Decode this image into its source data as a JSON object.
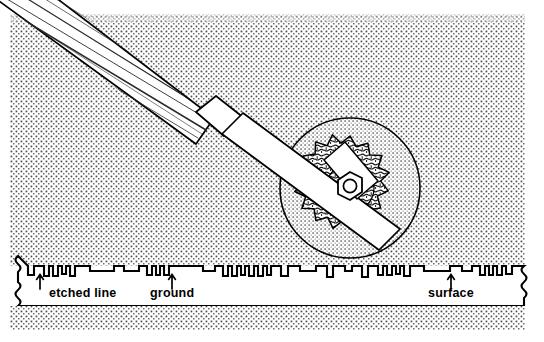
{
  "figure": {
    "kind": "technical-line-illustration",
    "width": 544,
    "height": 342,
    "background_color": "#ffffff",
    "ink_color": "#000000",
    "stipple_color": "#3a3a3a"
  },
  "scene": {
    "tool": {
      "name": "hand tool with wooden handle",
      "parts": [
        {
          "id": "handle",
          "label": "wooden handle",
          "texture": "wood-grain-striations",
          "fill": "#ffffff"
        },
        {
          "id": "ferrule",
          "label": "ferrule",
          "texture": "plain",
          "fill": "#ffffff"
        },
        {
          "id": "shank",
          "label": "flat steel shank",
          "texture": "plain",
          "fill": "#ffffff"
        },
        {
          "id": "pad",
          "label": "mounting pad",
          "texture": "plain",
          "fill": "#ffffff"
        }
      ],
      "fastener": {
        "id": "hex-nut",
        "label": "hex nut",
        "shape": "hexagon-with-round-bore"
      }
    },
    "wheel": {
      "name": "abrasive grinding wheel",
      "center_x": 350,
      "center_y": 188,
      "radius": 70,
      "rim_texture": "fine-stipple",
      "hub": {
        "label": "star-shaped abrasive hub",
        "points": 16,
        "outer_radius": 52,
        "inner_radius": 41,
        "texture": "coarse-squiggle"
      }
    },
    "background": {
      "texture": "dot-screen-halftone",
      "upper_field": {
        "x": 10,
        "y": 14,
        "width": 515,
        "height": 250
      },
      "lower_field": {
        "x": 10,
        "y": 306,
        "width": 515,
        "height": 24
      }
    }
  },
  "cross_section": {
    "name": "surface cross-section band",
    "left_break": "wavy",
    "right_break": "wavy",
    "top_y": 266,
    "bottom_y": 306,
    "fill": "#ffffff",
    "profile_description": "irregular square-wave notches representing etched lines in a ground surface",
    "notches": [
      {
        "x": 28,
        "w": 6,
        "d": 9
      },
      {
        "x": 44,
        "w": 5,
        "d": 10
      },
      {
        "x": 53,
        "w": 5,
        "d": 10
      },
      {
        "x": 62,
        "w": 4,
        "d": 8
      },
      {
        "x": 70,
        "w": 5,
        "d": 10
      },
      {
        "x": 90,
        "w": 24,
        "d": 5
      },
      {
        "x": 124,
        "w": 15,
        "d": 5
      },
      {
        "x": 147,
        "w": 5,
        "d": 9
      },
      {
        "x": 156,
        "w": 4,
        "d": 9
      },
      {
        "x": 164,
        "w": 5,
        "d": 9
      },
      {
        "x": 203,
        "w": 12,
        "d": 5
      },
      {
        "x": 223,
        "w": 5,
        "d": 10
      },
      {
        "x": 232,
        "w": 5,
        "d": 10
      },
      {
        "x": 241,
        "w": 4,
        "d": 9
      },
      {
        "x": 249,
        "w": 5,
        "d": 10
      },
      {
        "x": 258,
        "w": 5,
        "d": 10
      },
      {
        "x": 267,
        "w": 4,
        "d": 9
      },
      {
        "x": 281,
        "w": 7,
        "d": 10
      },
      {
        "x": 300,
        "w": 16,
        "d": 5
      },
      {
        "x": 327,
        "w": 6,
        "d": 11
      },
      {
        "x": 345,
        "w": 7,
        "d": 5
      },
      {
        "x": 362,
        "w": 6,
        "d": 11
      },
      {
        "x": 378,
        "w": 5,
        "d": 9
      },
      {
        "x": 387,
        "w": 5,
        "d": 9
      },
      {
        "x": 396,
        "w": 4,
        "d": 8
      },
      {
        "x": 404,
        "w": 6,
        "d": 10
      },
      {
        "x": 424,
        "w": 26,
        "d": 5
      },
      {
        "x": 462,
        "w": 10,
        "d": 5
      },
      {
        "x": 480,
        "w": 5,
        "d": 9
      },
      {
        "x": 489,
        "w": 4,
        "d": 9
      },
      {
        "x": 497,
        "w": 5,
        "d": 9
      },
      {
        "x": 506,
        "w": 4,
        "d": 8
      }
    ],
    "callouts": [
      {
        "id": "etched-line",
        "label": "etched line",
        "arrow_x": 40,
        "arrow_top_y": 274,
        "arrow_bottom_y": 288,
        "text_x": 49,
        "text_y": 297
      },
      {
        "id": "ground",
        "label": "ground",
        "arrow_x": 172,
        "arrow_top_y": 274,
        "arrow_bottom_y": 288,
        "text_x": 150,
        "text_y": 297
      },
      {
        "id": "surface",
        "label": "surface",
        "arrow_x": 451,
        "arrow_top_y": 274,
        "arrow_bottom_y": 288,
        "text_x": 428,
        "text_y": 297
      }
    ]
  }
}
